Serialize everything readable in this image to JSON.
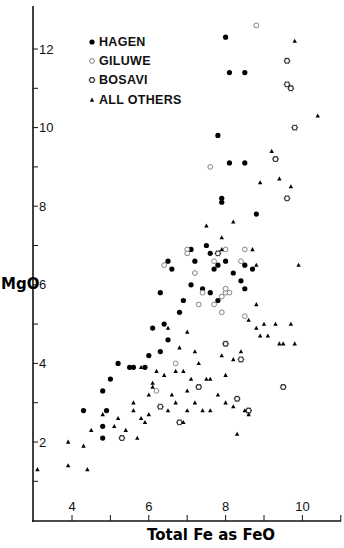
{
  "chart_data": {
    "type": "scatter",
    "title": "",
    "xlabel": "Total Fe as FeO",
    "ylabel": "MgO",
    "xlim": [
      3.0,
      11.0
    ],
    "ylim": [
      0.6,
      12.9
    ],
    "x_ticks": [
      4,
      5,
      6,
      7,
      8,
      9,
      10,
      11
    ],
    "x_tick_labels": [
      "4",
      "",
      "6",
      "",
      "8",
      "",
      "10",
      ""
    ],
    "y_ticks": [
      1,
      2,
      3,
      4,
      5,
      6,
      7,
      8,
      9,
      10,
      11,
      12
    ],
    "y_tick_labels": [
      "",
      "2",
      "",
      "4",
      "",
      "6",
      "",
      "8",
      "",
      "10",
      "",
      "12"
    ],
    "grid": false,
    "legend_position": "upper-left",
    "legend": [
      {
        "label": "HAGEN",
        "marker": "filled-circle"
      },
      {
        "label": "GILUWE",
        "marker": "open-circle"
      },
      {
        "label": "BOSAVI",
        "marker": "star-circle"
      },
      {
        "label": "ALL OTHERS",
        "marker": "filled-triangle"
      }
    ],
    "completeness_note": "Points below were read off the image at roughly 0.1-unit precision. The dense central clusters (roughly FeO 6.8-9.5, MgO 2.5-7.0) contain more points than were transcribed individually; 'dense_cluster_approx' values there are representative placements, not exact reads. Total point count is not exact.",
    "series": [
      {
        "name": "HAGEN",
        "marker": "filled-circle",
        "points": [
          [
            8.0,
            12.3
          ],
          [
            8.1,
            11.4
          ],
          [
            8.5,
            11.4
          ],
          [
            7.8,
            9.8
          ],
          [
            8.1,
            9.1
          ],
          [
            8.5,
            9.1
          ],
          [
            7.9,
            8.2
          ],
          [
            7.9,
            8.1
          ],
          [
            8.8,
            7.8
          ],
          [
            7.5,
            7.0
          ],
          [
            7.1,
            6.9
          ],
          [
            7.6,
            6.8
          ],
          [
            7.2,
            6.6
          ],
          [
            8.5,
            6.5
          ],
          [
            8.7,
            6.4
          ],
          [
            7.1,
            6.0
          ],
          [
            7.7,
            6.4
          ],
          [
            8.2,
            6.3
          ],
          [
            8.0,
            6.6
          ],
          [
            7.8,
            6.5
          ],
          [
            7.4,
            5.9
          ],
          [
            7.6,
            5.8
          ],
          [
            7.8,
            5.6
          ],
          [
            8.5,
            5.9
          ],
          [
            8.4,
            6.1
          ],
          [
            6.9,
            5.6
          ],
          [
            6.8,
            5.3
          ],
          [
            6.4,
            5.0
          ],
          [
            6.1,
            4.9
          ],
          [
            6.5,
            4.6
          ],
          [
            6.3,
            4.3
          ],
          [
            6.0,
            4.2
          ],
          [
            5.9,
            3.9
          ],
          [
            5.5,
            3.9
          ],
          [
            5.2,
            4.0
          ],
          [
            5.0,
            3.6
          ],
          [
            4.8,
            3.3
          ],
          [
            4.9,
            2.8
          ],
          [
            4.3,
            2.8
          ],
          [
            4.8,
            2.4
          ],
          [
            4.8,
            2.1
          ],
          [
            6.6,
            6.4
          ],
          [
            6.5,
            6.6
          ],
          [
            6.3,
            5.8
          ],
          [
            5.6,
            3.9
          ]
        ]
      },
      {
        "name": "GILUWE",
        "marker": "open-circle",
        "points": [
          [
            8.8,
            12.6
          ],
          [
            7.6,
            9.0
          ],
          [
            6.4,
            6.5
          ],
          [
            7.0,
            6.9
          ],
          [
            7.0,
            6.8
          ],
          [
            7.2,
            6.3
          ],
          [
            7.4,
            5.8
          ],
          [
            7.7,
            6.6
          ],
          [
            8.0,
            6.9
          ],
          [
            8.5,
            6.9
          ],
          [
            8.4,
            6.6
          ],
          [
            7.3,
            5.5
          ],
          [
            7.7,
            5.5
          ],
          [
            8.5,
            5.2
          ],
          [
            7.9,
            5.7
          ],
          [
            8.0,
            5.8
          ],
          [
            8.1,
            5.8
          ],
          [
            7.9,
            5.3
          ],
          [
            6.7,
            4.0
          ],
          [
            8.0,
            5.9
          ],
          [
            6.2,
            3.3
          ]
        ]
      },
      {
        "name": "BOSAVI",
        "marker": "star-circle",
        "points": [
          [
            9.6,
            11.7
          ],
          [
            9.6,
            11.1
          ],
          [
            9.7,
            11.0
          ],
          [
            9.8,
            10.0
          ],
          [
            9.3,
            9.2
          ],
          [
            9.6,
            8.2
          ],
          [
            7.8,
            6.8
          ],
          [
            5.3,
            2.1
          ],
          [
            6.3,
            2.9
          ],
          [
            7.3,
            3.4
          ],
          [
            8.0,
            4.5
          ],
          [
            8.4,
            4.1
          ],
          [
            9.5,
            3.4
          ],
          [
            8.3,
            3.1
          ],
          [
            6.8,
            2.5
          ],
          [
            8.6,
            2.8
          ]
        ]
      },
      {
        "name": "ALL OTHERS",
        "marker": "filled-triangle",
        "points": [
          [
            9.8,
            12.2
          ],
          [
            10.4,
            10.3
          ],
          [
            9.2,
            9.4
          ],
          [
            9.4,
            8.7
          ],
          [
            9.7,
            8.5
          ],
          [
            8.9,
            8.6
          ],
          [
            8.2,
            7.6
          ],
          [
            7.5,
            7.5
          ],
          [
            8.8,
            6.5
          ],
          [
            9.9,
            6.5
          ],
          [
            7.9,
            7.2
          ],
          [
            8.8,
            5.5
          ],
          [
            9.3,
            5.0
          ],
          [
            9.4,
            4.5
          ],
          [
            9.5,
            4.5
          ],
          [
            9.1,
            4.7
          ],
          [
            9.8,
            4.5
          ],
          [
            8.6,
            5.1
          ],
          [
            8.8,
            4.9
          ],
          [
            9.0,
            5.0
          ],
          [
            8.9,
            4.7
          ],
          [
            8.2,
            4.1
          ],
          [
            7.9,
            4.2
          ],
          [
            7.0,
            4.8
          ],
          [
            6.5,
            4.9
          ],
          [
            6.8,
            4.4
          ],
          [
            7.2,
            4.3
          ],
          [
            7.3,
            4.0
          ],
          [
            6.9,
            3.8
          ],
          [
            7.5,
            3.6
          ],
          [
            7.0,
            3.3
          ],
          [
            7.8,
            3.2
          ],
          [
            8.0,
            3.0
          ],
          [
            8.2,
            2.9
          ],
          [
            7.6,
            2.8
          ],
          [
            8.5,
            2.8
          ],
          [
            8.6,
            2.7
          ],
          [
            6.2,
            3.8
          ],
          [
            6.4,
            3.7
          ],
          [
            6.7,
            3.8
          ],
          [
            6.1,
            3.5
          ],
          [
            6.6,
            3.2
          ],
          [
            7.2,
            3.0
          ],
          [
            7.4,
            2.8
          ],
          [
            6.9,
            2.5
          ],
          [
            6.7,
            3.0
          ],
          [
            7.0,
            2.8
          ],
          [
            6.5,
            2.8
          ],
          [
            6.0,
            3.2
          ],
          [
            5.6,
            3.0
          ],
          [
            5.9,
            2.5
          ],
          [
            5.8,
            2.6
          ],
          [
            5.6,
            2.8
          ],
          [
            5.1,
            2.4
          ],
          [
            5.2,
            2.6
          ],
          [
            4.8,
            2.7
          ],
          [
            4.5,
            2.3
          ],
          [
            3.9,
            2.0
          ],
          [
            4.3,
            1.9
          ],
          [
            3.9,
            1.4
          ],
          [
            3.1,
            1.3
          ],
          [
            4.4,
            1.3
          ],
          [
            5.8,
            3.9
          ],
          [
            6.1,
            3.4
          ],
          [
            6.0,
            2.7
          ],
          [
            5.4,
            2.3
          ],
          [
            5.7,
            2.1
          ],
          [
            8.4,
            4.3
          ],
          [
            8.0,
            3.7
          ],
          [
            7.6,
            3.6
          ],
          [
            7.1,
            3.6
          ],
          [
            9.7,
            5.0
          ],
          [
            8.3,
            2.2
          ],
          [
            7.9,
            6.9
          ],
          [
            8.7,
            6.9
          ]
        ]
      }
    ]
  }
}
